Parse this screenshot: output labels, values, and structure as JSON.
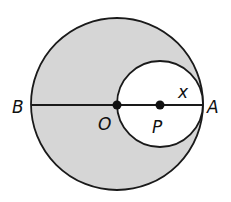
{
  "diagram": {
    "labels": {
      "B": "B",
      "O": "O",
      "P": "P",
      "A": "A",
      "x": "x"
    },
    "colors": {
      "shaded_region": "#d6d6d6",
      "stroke": "#1a1a1a",
      "background": "#ffffff"
    }
  }
}
